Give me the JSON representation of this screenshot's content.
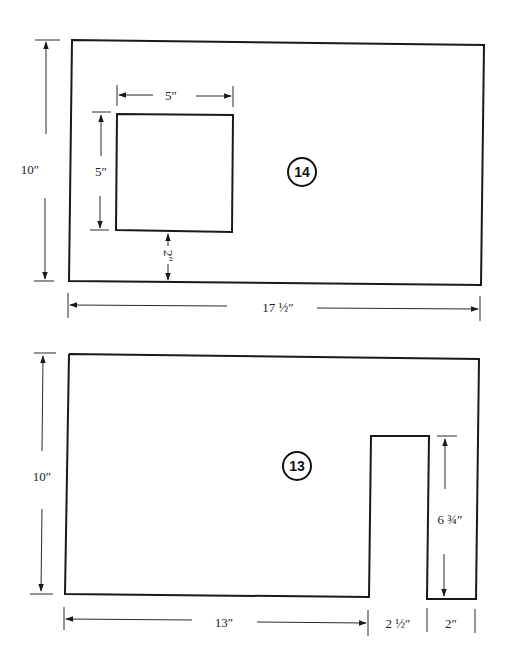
{
  "diagram": {
    "type": "dimensioned-panel-drawings",
    "panels": [
      {
        "id": "panel-14",
        "label": "14",
        "dimensions": {
          "height": "10″",
          "width": "17 ½″",
          "cutout_width": "5″",
          "cutout_height": "5″",
          "cutout_bottom_offset": "2″"
        }
      },
      {
        "id": "panel-13",
        "label": "13",
        "dimensions": {
          "height": "10″",
          "left_width": "13″",
          "slot_width": "2 ½″",
          "right_width": "2″",
          "slot_depth": "6 ¾″"
        }
      }
    ],
    "colors": {
      "line": "#1a1a1a",
      "background": "#ffffff"
    }
  }
}
